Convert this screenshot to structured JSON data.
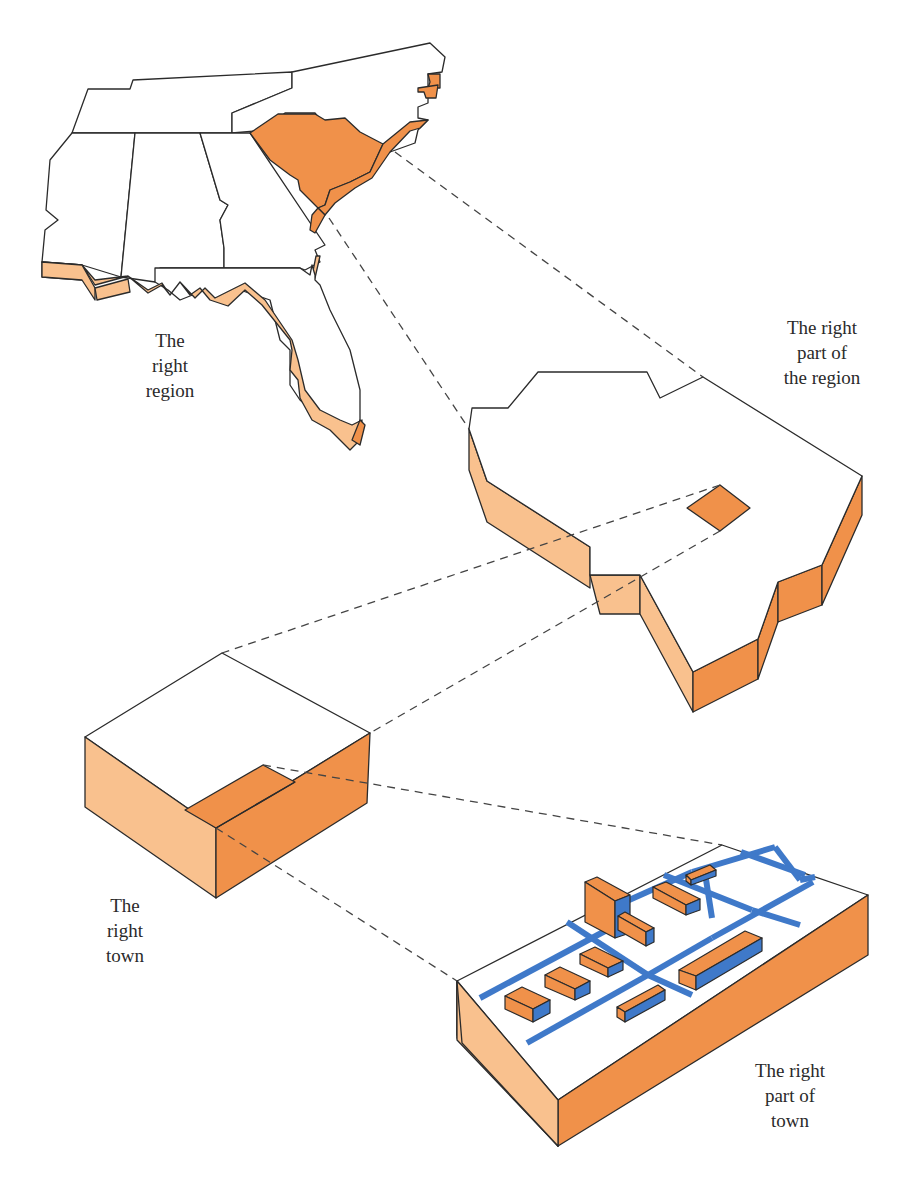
{
  "diagram": {
    "colors": {
      "highlight": "#f0914a",
      "side_light": "#f9c18e",
      "side_dark": "#f0914a",
      "road": "#3f79c9",
      "outline": "#2b2b2b",
      "dashed": "#444444"
    },
    "labels": {
      "region": [
        "The",
        "right",
        "region"
      ],
      "part_region": [
        "The right",
        "part of",
        "the region"
      ],
      "town": [
        "The",
        "right",
        "town"
      ],
      "part_town": [
        "The right",
        "part of",
        "town"
      ]
    }
  }
}
